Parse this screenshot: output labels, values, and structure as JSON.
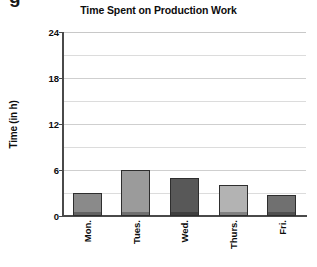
{
  "figure": {
    "cropped_glyph": "g"
  },
  "chart_data": {
    "type": "bar",
    "title": "Time Spent on Production Work",
    "xlabel": "",
    "ylabel": "Time (in h)",
    "categories": [
      "Mon.",
      "Tues.",
      "Wed.",
      "Thurs.",
      "Fri."
    ],
    "values": [
      3,
      6,
      5,
      4,
      2.75
    ],
    "ylim": [
      0,
      24
    ],
    "ytick_labels": [
      "0",
      "6",
      "12",
      "18",
      "24"
    ],
    "ytick_values": [
      0,
      6,
      12,
      18,
      24
    ],
    "gridline_values": [
      3,
      6,
      9,
      12,
      15,
      18,
      21,
      24
    ],
    "grid": true,
    "legend": "none",
    "bar_colors": [
      "#8a8a8a",
      "#9b9b9b",
      "#585858",
      "#b3b3b3",
      "#707070"
    ],
    "bar_edge_color": "#2e2e2e",
    "axis_color": "#4a4a4a",
    "grid_color": "#dcdcdc",
    "background": "#ffffff"
  }
}
